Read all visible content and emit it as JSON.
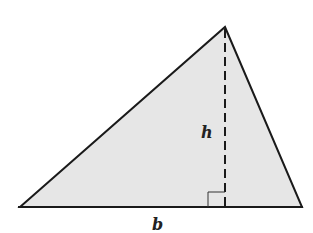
{
  "diagram": {
    "type": "triangle-area",
    "fill_color": "#e6e6e6",
    "stroke_color": "#1a1a1a",
    "labels": {
      "height": "h",
      "base": "b"
    },
    "vertices": {
      "left": [
        20,
        207
      ],
      "right": [
        302,
        207
      ],
      "apex": [
        225,
        27
      ]
    },
    "altitude": {
      "style": "dashed",
      "from": [
        225,
        27
      ],
      "to": [
        225,
        207
      ],
      "right_angle_marker": true
    }
  }
}
